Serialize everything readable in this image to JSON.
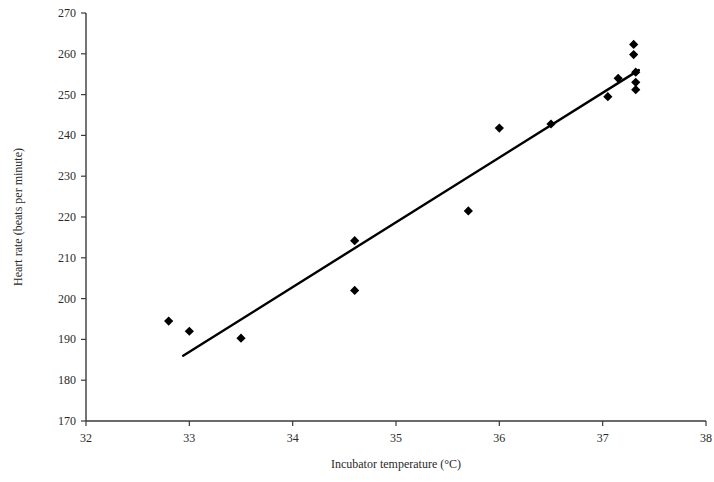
{
  "chart_data": {
    "type": "scatter",
    "title": "",
    "xlabel": "Incubator temperature (°C)",
    "ylabel": "Heart rate (beats per minute)",
    "xlim": [
      32,
      38
    ],
    "ylim": [
      170,
      270
    ],
    "xticks": [
      32,
      33,
      34,
      35,
      36,
      37,
      38
    ],
    "xtick_labels": [
      "32",
      "33",
      "34",
      "35",
      "36",
      "37",
      "38"
    ],
    "yticks": [
      170,
      180,
      190,
      200,
      210,
      220,
      230,
      240,
      250,
      260,
      270
    ],
    "ytick_labels": [
      "170",
      "180",
      "190",
      "200",
      "210",
      "220",
      "230",
      "240",
      "250",
      "260",
      "270"
    ],
    "grid": false,
    "legend": "none",
    "marker": "diamond",
    "marker_color": "#000000",
    "points": [
      {
        "x": 32.8,
        "y": 194.5
      },
      {
        "x": 33.0,
        "y": 192.0
      },
      {
        "x": 33.5,
        "y": 190.3
      },
      {
        "x": 34.6,
        "y": 214.2
      },
      {
        "x": 34.6,
        "y": 202.0
      },
      {
        "x": 35.7,
        "y": 221.5
      },
      {
        "x": 36.0,
        "y": 241.8
      },
      {
        "x": 36.5,
        "y": 242.8
      },
      {
        "x": 37.05,
        "y": 249.5
      },
      {
        "x": 37.15,
        "y": 254.0
      },
      {
        "x": 37.3,
        "y": 262.3
      },
      {
        "x": 37.3,
        "y": 259.8
      },
      {
        "x": 37.32,
        "y": 255.5
      },
      {
        "x": 37.32,
        "y": 253.0
      },
      {
        "x": 37.32,
        "y": 251.2
      }
    ],
    "trendline": {
      "x_start": 32.94,
      "y_start": 186.0,
      "x_end": 37.35,
      "y_end": 256.0,
      "color": "#000000",
      "width": 2.4
    }
  },
  "axes": {
    "axis_color": "#3a3a3a",
    "tick_length": 5
  }
}
